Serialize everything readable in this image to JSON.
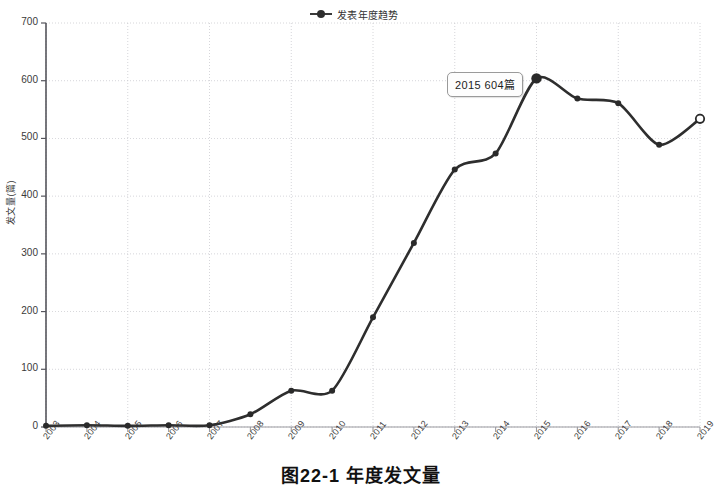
{
  "figure": {
    "caption": "图22-1  年度发文量",
    "legend": {
      "label": "发表年度趋势",
      "marker_icon": "line-marker-icon"
    },
    "tooltip": {
      "text": "2015  604篇",
      "year": 2015,
      "value": 604,
      "unit": "篇"
    }
  },
  "chart_data": {
    "type": "line",
    "title": "",
    "subtitle": "",
    "xlabel": "",
    "ylabel": "发文量(篇)",
    "series_name": "发表年度趋势",
    "categories": [
      "2003",
      "2004",
      "2005",
      "2006",
      "2007",
      "2008",
      "2009",
      "2010",
      "2011",
      "2012",
      "2013",
      "2014",
      "2015",
      "2016",
      "2017",
      "2018",
      "2019"
    ],
    "values": [
      2,
      3,
      2,
      3,
      3,
      22,
      63,
      63,
      190,
      319,
      446,
      474,
      604,
      569,
      561,
      489,
      534
    ],
    "series": [
      {
        "name": "发表年度趋势",
        "values": [
          2,
          3,
          2,
          3,
          3,
          22,
          63,
          63,
          190,
          319,
          446,
          474,
          604,
          569,
          561,
          489,
          534
        ]
      }
    ],
    "ylim": [
      0,
      700
    ],
    "yticks": [
      0,
      100,
      200,
      300,
      400,
      500,
      600,
      700
    ],
    "xticks": [
      "2003",
      "2004",
      "2005",
      "2006",
      "2007",
      "2008",
      "2009",
      "2010",
      "2011",
      "2012",
      "2013",
      "2014",
      "2015",
      "2016",
      "2017",
      "2018",
      "2019"
    ],
    "grid": true,
    "legend_position": "top-center",
    "highlight_point": {
      "year": "2015",
      "value": 604
    },
    "open_marker_point": {
      "year": "2019",
      "value": 534
    },
    "colors": {
      "line": "#2e2e2e",
      "marker": "#2a2a2a",
      "grid": "#c9c9cf",
      "axis": "#55555c",
      "background": "#ffffff"
    },
    "annotations": [
      {
        "type": "tooltip",
        "at": "2015",
        "text": "2015  604篇"
      }
    ]
  }
}
